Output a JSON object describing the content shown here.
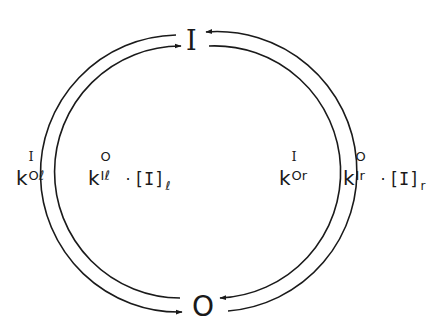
{
  "diagram": {
    "type": "two-state kinetic cycle",
    "states": {
      "top": "I",
      "bottom": "O"
    },
    "colors": {
      "stroke": "#1a1a1a",
      "background": "#ffffff"
    },
    "transitions": [
      {
        "id": "left-outer",
        "from": "I",
        "to": "O",
        "side": "left",
        "rate": {
          "base": "k",
          "superscript": "I",
          "subscript": "Oℓ"
        },
        "concentration": null
      },
      {
        "id": "left-inner",
        "from": "O",
        "to": "I",
        "side": "left",
        "rate": {
          "base": "k",
          "superscript": "O",
          "subscript": "Iℓ"
        },
        "multiplier": "·",
        "concentration": {
          "text": "[I]",
          "subscript": "ℓ"
        }
      },
      {
        "id": "right-inner",
        "from": "I",
        "to": "O",
        "side": "right",
        "rate": {
          "base": "k",
          "superscript": "I",
          "subscript": "Or"
        },
        "concentration": null
      },
      {
        "id": "right-outer",
        "from": "O",
        "to": "I",
        "side": "right",
        "rate": {
          "base": "k",
          "superscript": "O",
          "subscript": "Ir"
        },
        "multiplier": "·",
        "concentration": {
          "text": "[I]",
          "subscript": "r"
        }
      }
    ]
  }
}
